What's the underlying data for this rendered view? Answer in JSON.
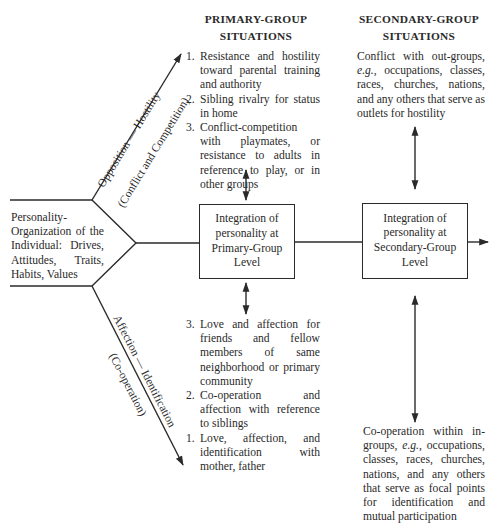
{
  "primary": {
    "heading_line1": "PRIMARY-GROUP",
    "heading_line2": "SITUATIONS",
    "opposition_items": [
      {
        "num": "1.",
        "text": "Resistance and hostility toward parental training and authority"
      },
      {
        "num": "2.",
        "text": "Sibling rivalry for status in home"
      },
      {
        "num": "3.",
        "text": "Conflict-competition with playmates, or resistance to adults in reference to play, or in other groups"
      }
    ],
    "affection_items": [
      {
        "num": "3.",
        "text": "Love and affection for friends and fellow members of same neighborhood or primary community"
      },
      {
        "num": "2.",
        "text": "Co-operation and affection with reference to siblings"
      },
      {
        "num": "1.",
        "text": "Love, affection, and identification with mother, father"
      }
    ],
    "box_text": "Integration of personality at Primary-Group Level"
  },
  "secondary": {
    "heading_line1": "SECONDARY-GROUP",
    "heading_line2": "SITUATIONS",
    "conflict_pre": "Conflict with out-groups, ",
    "conflict_eg": "e.g.",
    "conflict_post": ", occupations, classes, races, churches, nations, and any others that serve as outlets for hostility",
    "coop_pre": "Co-operation within in-groups, ",
    "coop_eg": "e.g.",
    "coop_post": ", occupations, classes, races, churches, nations, and any others that serve as focal points for identification and mutual participation",
    "box_text": "Integration of personality at Secondary-Group Level"
  },
  "personality": {
    "text": "Personality-Organization of the Individual: Drives, Attitudes, Traits, Habits, Values"
  },
  "arrows": {
    "upper_label_line1": "Opposition — Hostility",
    "upper_label_line2": "(Conflict and Competition)",
    "lower_label_line1": "Affection — Identification",
    "lower_label_line2": "(Co-operation)"
  },
  "colors": {
    "ink": "#2a2a2a",
    "background": "#ffffff"
  }
}
